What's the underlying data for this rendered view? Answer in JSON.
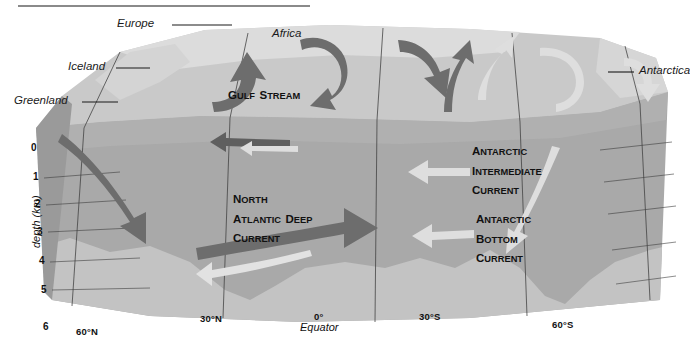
{
  "figure": {
    "title_rule": true,
    "type": "ocean-thermohaline-circulation-block-diagram"
  },
  "axes": {
    "depth_axis_label": "depth (km)",
    "depth_ticks": [
      "0",
      "1",
      "2",
      "3",
      "4",
      "5",
      "6"
    ],
    "depth_unit": "km",
    "depth_range": [
      0,
      6
    ],
    "latitude_ticks": [
      {
        "label": "60°N"
      },
      {
        "label": "30°N"
      },
      {
        "label": "0°"
      },
      {
        "label": "30°S"
      },
      {
        "label": "60°S"
      }
    ],
    "equator_label": "Equator"
  },
  "places": [
    {
      "name": "Europe"
    },
    {
      "name": "Iceland"
    },
    {
      "name": "Greenland"
    },
    {
      "name": "Africa"
    },
    {
      "name": "Antarctica"
    }
  ],
  "currents": [
    {
      "name": "gulf-stream",
      "lines": [
        "Gulf Stream"
      ],
      "tone": "dark"
    },
    {
      "name": "north-atlantic-deep-current",
      "lines": [
        "North",
        "Atlantic Deep",
        "Current"
      ],
      "tone": "dark"
    },
    {
      "name": "antarctic-intermediate-current",
      "lines": [
        "Antarctic",
        "Intermediate",
        "Current"
      ],
      "tone": "light"
    },
    {
      "name": "antarctic-bottom-current",
      "lines": [
        "Antarctic",
        "Bottom",
        "Current"
      ],
      "tone": "light"
    }
  ],
  "colors": {
    "top_surface": "#c9c9c9",
    "land_band": "#d6d6d6",
    "water_body": "#a9a9a9",
    "water_upper": "#b0b0b0",
    "seafloor": "#bdbdbd",
    "dark_arrow": "#6d6d6d",
    "light_arrow": "#dedede",
    "grid_line": "#4a4a4a",
    "rule": "#8a8a8a",
    "text": "#1a1a1a"
  }
}
